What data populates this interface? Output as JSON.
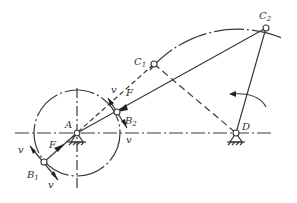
{
  "diagram": {
    "type": "four-bar linkage (crank-rocker) dead-point diagram",
    "colors": {
      "line": "#3a3a3a",
      "background": "#ffffff"
    },
    "points": {
      "A": {
        "label": "A",
        "x": 77,
        "y": 133
      },
      "B1": {
        "label": "B",
        "sub": "1",
        "x": 44,
        "y": 162
      },
      "B2": {
        "label": "B",
        "sub": "2",
        "x": 117,
        "y": 112
      },
      "C1": {
        "label": "C",
        "sub": "1",
        "x": 154,
        "y": 64
      },
      "C2": {
        "label": "C",
        "sub": "2",
        "x": 266,
        "y": 28
      },
      "D": {
        "label": "D",
        "x": 236,
        "y": 133
      }
    },
    "labels": {
      "A": "A",
      "B": "B",
      "C": "C",
      "D": "D",
      "sub1": "1",
      "sub2": "2",
      "force_top": "F",
      "force_bottom": "F",
      "vel_top": "v",
      "vel_right": "v",
      "vel_left": "v",
      "vel_bottom": "v"
    },
    "annotations": [
      "Crank AB circle (dash-dot) centered at A",
      "Rocker arc (dash-dot) centered at D through C1 and C2",
      "Dead-point positions AB1C1 (dashed) and AB2C2 (solid)",
      "Rotation arrow near rocker CD"
    ]
  }
}
